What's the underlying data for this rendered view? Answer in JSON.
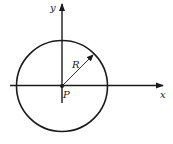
{
  "diagram": {
    "labels": {
      "x_axis": "x",
      "y_axis": "y",
      "radius": "R",
      "center": "P"
    },
    "colors": {
      "stroke": "#1a1a1a",
      "background": "#ffffff"
    }
  }
}
